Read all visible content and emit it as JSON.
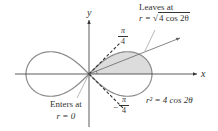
{
  "diagram": {
    "axes": {
      "x_label": "x",
      "y_label": "y"
    },
    "curve_label": "r² = 4 cos 2θ",
    "leaves_label": {
      "line1": "Leaves at",
      "line2_prefix": "r = ",
      "line2_root": "4 cos 2θ"
    },
    "enters_label": {
      "line1": "Enters at",
      "line2": "r = 0"
    },
    "angle_upper": {
      "num": "π",
      "den": "4",
      "sign": ""
    },
    "angle_lower": {
      "num": "π",
      "den": "4",
      "sign": "−"
    },
    "colors": {
      "curve": "#8a8a8a",
      "shade": "#d9d9d9",
      "axis": "#333333"
    }
  }
}
